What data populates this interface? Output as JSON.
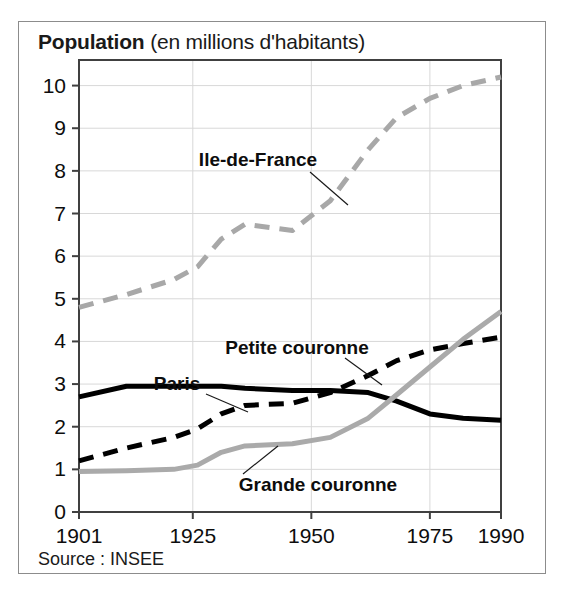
{
  "figure": {
    "title_bold": "Population",
    "title_rest": " (en millions d'habitants)",
    "source": "Source : INSEE"
  },
  "chart_data": {
    "type": "line",
    "title": "Population (en millions d'habitants)",
    "xlabel": "",
    "ylabel": "",
    "xlim": [
      1901,
      1990
    ],
    "ylim": [
      0,
      10.6
    ],
    "grid": true,
    "legend_position": "inline-annotations",
    "xticks": [
      1901,
      1925,
      1950,
      1975,
      1990
    ],
    "xtick_labels": [
      "1901",
      "1925",
      "1950",
      "1975",
      "1990"
    ],
    "yticks": [
      0,
      1,
      2,
      3,
      4,
      5,
      6,
      7,
      8,
      9,
      10
    ],
    "ytick_labels": [
      "0",
      "1",
      "2",
      "3",
      "4",
      "5",
      "6",
      "7",
      "8",
      "9",
      "10"
    ],
    "source_note": "Source : INSEE",
    "series": [
      {
        "name": "Ile-de-France",
        "style": "dashed",
        "color": "#a8a8a8",
        "x": [
          1901,
          1911,
          1921,
          1926,
          1931,
          1936,
          1946,
          1954,
          1962,
          1968,
          1975,
          1982,
          1990
        ],
        "values": [
          4.8,
          5.1,
          5.45,
          5.75,
          6.4,
          6.75,
          6.6,
          7.3,
          8.5,
          9.25,
          9.7,
          10.0,
          10.2
        ]
      },
      {
        "name": "Petite couronne",
        "style": "dashed",
        "color": "#000000",
        "x": [
          1901,
          1911,
          1921,
          1926,
          1931,
          1936,
          1946,
          1954,
          1962,
          1968,
          1975,
          1982,
          1990
        ],
        "values": [
          1.2,
          1.5,
          1.75,
          1.95,
          2.3,
          2.5,
          2.55,
          2.8,
          3.2,
          3.55,
          3.8,
          3.95,
          4.1
        ]
      },
      {
        "name": "Paris",
        "style": "solid",
        "color": "#000000",
        "x": [
          1901,
          1911,
          1921,
          1926,
          1931,
          1936,
          1946,
          1954,
          1962,
          1968,
          1975,
          1982,
          1990
        ],
        "values": [
          2.7,
          2.95,
          2.95,
          2.95,
          2.95,
          2.9,
          2.85,
          2.85,
          2.8,
          2.6,
          2.3,
          2.2,
          2.15
        ]
      },
      {
        "name": "Grande couronne",
        "style": "solid",
        "color": "#aaaaaa",
        "x": [
          1901,
          1911,
          1921,
          1926,
          1931,
          1936,
          1946,
          1954,
          1962,
          1968,
          1975,
          1982,
          1990
        ],
        "values": [
          0.95,
          0.97,
          1.0,
          1.1,
          1.4,
          1.55,
          1.6,
          1.75,
          2.2,
          2.75,
          3.4,
          4.05,
          4.7
        ]
      }
    ],
    "annotations": [
      {
        "text": "Ile-de-France",
        "label_x": 258,
        "label_y": 160,
        "leader": [
          [
            310,
            172
          ],
          [
            348,
            205
          ]
        ]
      },
      {
        "text": "Petite couronne",
        "label_x": 297,
        "label_y": 348,
        "leader": [
          [
            345,
            358
          ],
          [
            382,
            385
          ]
        ]
      },
      {
        "text": "Paris",
        "label_x": 177,
        "label_y": 384,
        "leader": [
          [
            206,
            394
          ],
          [
            248,
            412
          ]
        ]
      },
      {
        "text": "Grande couronne",
        "label_x": 318,
        "label_y": 485,
        "leader": [
          [
            243,
            474
          ],
          [
            278,
            446
          ]
        ]
      }
    ]
  }
}
